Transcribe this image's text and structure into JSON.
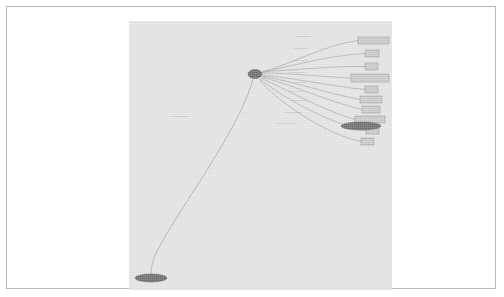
{
  "figure": {
    "kind": "graph-diagram",
    "layout": "hub-and-spoke",
    "background_color": "#ffffff",
    "canvas_color": "#e3e3e3",
    "frame_color": "#b9b9b9",
    "node_fill": "#c9c9c9",
    "node_stroke": "#8a8a8a",
    "ellipse_fill": "#6e6e6e",
    "edge_color": "#8f8f8f"
  },
  "nodes": {
    "hub": {
      "name": "hub-node",
      "shape": "ellipse",
      "label": "",
      "cx": 126,
      "cy": 53,
      "rx": 7,
      "ry": 4.5
    },
    "bottom": {
      "name": "bottom-node",
      "shape": "ellipse",
      "label": "",
      "cx": 22,
      "cy": 257,
      "rx": 16,
      "ry": 4
    },
    "right": {
      "name": "right-node",
      "shape": "ellipse",
      "label": "",
      "cx": 232,
      "cy": 105,
      "rx": 20,
      "ry": 4
    }
  },
  "boxes": [
    {
      "label": "",
      "x": 229,
      "y": 16,
      "w": 31,
      "h": 7
    },
    {
      "label": "",
      "x": 236,
      "y": 29,
      "w": 14,
      "h": 7
    },
    {
      "label": "",
      "x": 236,
      "y": 42,
      "w": 13,
      "h": 7
    },
    {
      "label": "",
      "x": 222,
      "y": 53,
      "w": 38,
      "h": 8
    },
    {
      "label": "",
      "x": 236,
      "y": 65,
      "w": 13,
      "h": 7
    },
    {
      "label": "",
      "x": 231,
      "y": 75,
      "w": 22,
      "h": 7
    },
    {
      "label": "",
      "x": 233,
      "y": 85,
      "w": 18,
      "h": 7
    },
    {
      "label": "",
      "x": 226,
      "y": 95,
      "w": 30,
      "h": 7
    },
    {
      "label": "",
      "x": 237,
      "y": 106,
      "w": 13,
      "h": 7
    },
    {
      "label": "",
      "x": 232,
      "y": 117,
      "w": 13,
      "h": 7
    }
  ],
  "edge_labels": [
    {
      "text": "",
      "x": 168,
      "y": 16
    },
    {
      "text": "",
      "x": 165,
      "y": 28
    },
    {
      "text": "",
      "x": 165,
      "y": 40
    },
    {
      "text": "",
      "x": 160,
      "y": 52
    },
    {
      "text": "",
      "x": 166,
      "y": 62
    },
    {
      "text": "",
      "x": 160,
      "y": 71
    },
    {
      "text": "",
      "x": 163,
      "y": 80
    },
    {
      "text": "",
      "x": 156,
      "y": 92
    },
    {
      "text": "",
      "x": 148,
      "y": 103
    },
    {
      "text": "",
      "x": 43,
      "y": 96
    }
  ]
}
